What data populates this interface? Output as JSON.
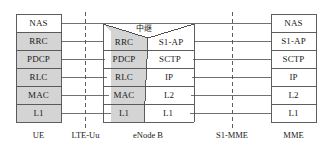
{
  "diagram": {
    "colors": {
      "shaded_fill": "#d4d4d4",
      "plain_fill": "#ffffff",
      "stroke": "#4d4d4d",
      "text": "#1a1a1a"
    },
    "ue_stack": {
      "node_label": "UE",
      "layers": [
        {
          "label": "NAS",
          "shaded": false
        },
        {
          "label": "RRC",
          "shaded": true
        },
        {
          "label": "PDCP",
          "shaded": true
        },
        {
          "label": "RLC",
          "shaded": true
        },
        {
          "label": "MAC",
          "shaded": true
        },
        {
          "label": "L1",
          "shaded": true
        }
      ]
    },
    "enodeb_stack": {
      "node_label": "eNode B",
      "relay_label": "中继",
      "left_layers": [
        {
          "label": "RRC",
          "shaded": true
        },
        {
          "label": "PDCP",
          "shaded": true
        },
        {
          "label": "RLC",
          "shaded": true
        },
        {
          "label": "MAC",
          "shaded": true
        },
        {
          "label": "L1",
          "shaded": true
        }
      ],
      "right_layers": [
        {
          "label": "S1-AP",
          "shaded": false
        },
        {
          "label": "SCTP",
          "shaded": false
        },
        {
          "label": "IP",
          "shaded": false
        },
        {
          "label": "L2",
          "shaded": false
        },
        {
          "label": "L1",
          "shaded": false
        }
      ]
    },
    "mme_stack": {
      "node_label": "MME",
      "layers": [
        {
          "label": "NAS",
          "shaded": false
        },
        {
          "label": "S1-AP",
          "shaded": false
        },
        {
          "label": "SCTP",
          "shaded": false
        },
        {
          "label": "IP",
          "shaded": false
        },
        {
          "label": "L2",
          "shaded": false
        },
        {
          "label": "L1",
          "shaded": false
        }
      ]
    },
    "interfaces": [
      {
        "label": "LTE-Uu",
        "style": "dashed"
      },
      {
        "label": "S1-MME",
        "style": "dashed"
      }
    ]
  }
}
